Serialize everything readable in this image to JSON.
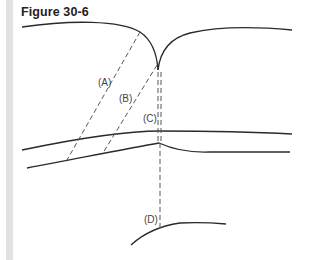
{
  "figure": {
    "title": "Figure 30-6",
    "labels": {
      "a": "(A)",
      "b": "(B)",
      "c": "(C)",
      "d": "(D)"
    }
  }
}
